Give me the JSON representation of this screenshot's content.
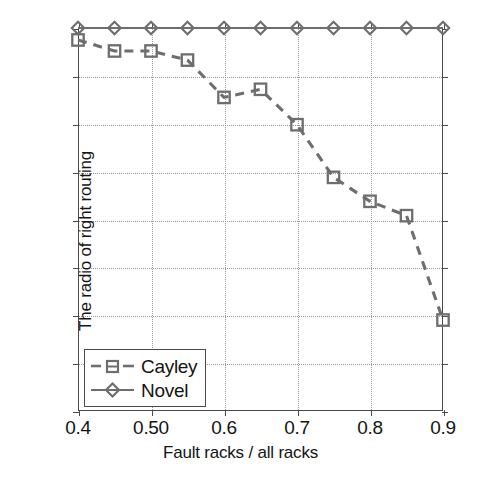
{
  "chart_data": {
    "type": "line",
    "title": "",
    "xlabel": "Fault racks / all racks",
    "ylabel": "The radio of right routing",
    "xlim": [
      0.4,
      0.9
    ],
    "ylim": [
      0.2,
      1.0
    ],
    "grid": true,
    "legend_position": "lower-left",
    "x": [
      0.4,
      0.45,
      0.5,
      0.55,
      0.6,
      0.65,
      0.7,
      0.75,
      0.8,
      0.85,
      0.9
    ],
    "xticks": [
      0.4,
      0.5,
      0.6,
      0.7,
      0.8,
      0.9
    ],
    "xticklabels": [
      "0.4",
      "0.50",
      "0.6",
      "0.7",
      "0.8",
      "0.9"
    ],
    "yticks": [
      0.2,
      0.3,
      0.4,
      0.5,
      0.6,
      0.7,
      0.8,
      0.9,
      1.0
    ],
    "yticklabels": [
      "0.2",
      "0.3",
      "0.4",
      "0.5",
      "0.6",
      "0.7",
      "0.8",
      "0.9",
      "1"
    ],
    "series": [
      {
        "name": "Cayley",
        "marker": "square",
        "linestyle": "dashed",
        "color": "#6e6e6e",
        "values": [
          0.975,
          0.952,
          0.952,
          0.933,
          0.855,
          0.872,
          0.798,
          0.688,
          0.638,
          0.608,
          0.39
        ]
      },
      {
        "name": "Novel",
        "marker": "diamond",
        "linestyle": "solid",
        "color": "#6e6e6e",
        "values": [
          1.0,
          1.0,
          1.0,
          1.0,
          1.0,
          1.0,
          1.0,
          1.0,
          1.0,
          1.0,
          1.0
        ]
      }
    ]
  },
  "legend": {
    "items": [
      {
        "label": "Cayley"
      },
      {
        "label": "Novel"
      }
    ]
  },
  "colors": {
    "series": "#6e6e6e",
    "axis": "#4a4a4a",
    "grid": "#9a9a9a",
    "text": "#141414",
    "background": "#ffffff"
  }
}
